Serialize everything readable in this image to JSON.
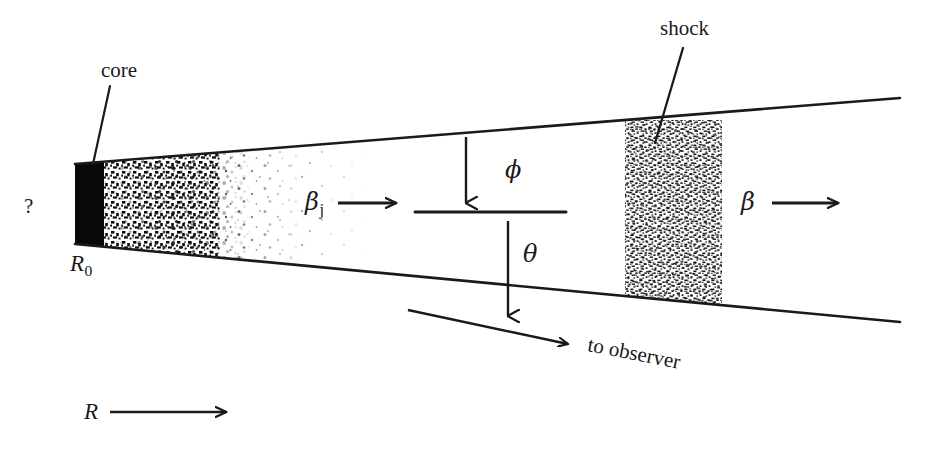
{
  "figure": {
    "background_color": "#ffffff",
    "ink_color": "#1a1a1a",
    "width": 925,
    "height": 460
  },
  "labels": {
    "core": "core",
    "shock": "shock",
    "question_mark": "?",
    "r_zero_symbol": "R",
    "r_zero_subscript": "0",
    "beta_jet_symbol": "β",
    "beta_jet_subscript": "j",
    "beta_symbol": "β",
    "phi": "ϕ",
    "theta": "θ",
    "r_axis_symbol": "R",
    "to_observer": "to observer"
  },
  "geometry": {
    "jet": {
      "apex_x": 75,
      "upper_edge": {
        "x1": 75,
        "y1": 164,
        "x2": 900,
        "y2": 98
      },
      "lower_edge": {
        "x1": 75,
        "y1": 244,
        "x2": 900,
        "y2": 322
      }
    },
    "core_block": {
      "x": 75,
      "y": 164,
      "width": 30,
      "height": 80
    },
    "grain_zone": {
      "x": 105,
      "y": 160,
      "width": 190,
      "height": 88
    },
    "shock_band": {
      "x": 625,
      "y": 128,
      "width": 97,
      "height": 172
    },
    "centerline": {
      "x1": 415,
      "y1": 212,
      "x2": 566,
      "y2": 212
    },
    "phi_arrow": {
      "x1": 466,
      "y1": 137,
      "x2": 466,
      "y2": 210
    },
    "theta_arrow": {
      "x1": 508,
      "y1": 315,
      "x2": 508,
      "y2": 214
    },
    "observer_arrow": {
      "x1": 408,
      "y1": 310,
      "x2": 578,
      "y2": 347
    },
    "r_axis_arrow": {
      "x1": 110,
      "y1": 412,
      "x2": 228,
      "y2": 412
    },
    "beta_jet_arrow": {
      "x1": 340,
      "y1": 203,
      "x2": 398,
      "y2": 203
    },
    "beta_arrow": {
      "x1": 774,
      "y1": 203,
      "x2": 840,
      "y2": 203
    },
    "core_leader": {
      "x1": 110,
      "y1": 86,
      "x2": 93,
      "y2": 163
    },
    "shock_leader": {
      "x1": 683,
      "y1": 48,
      "x2": 657,
      "y2": 140
    }
  }
}
